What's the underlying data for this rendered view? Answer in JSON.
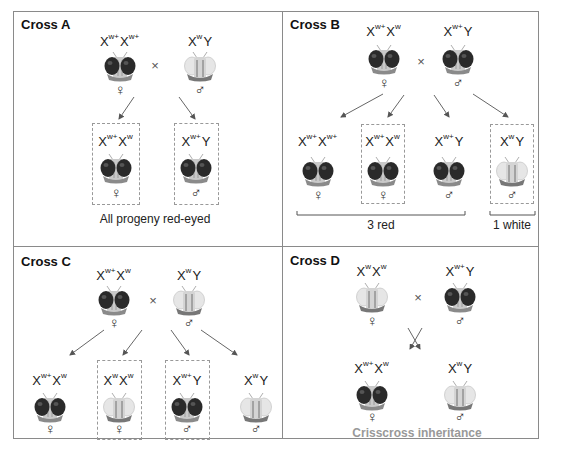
{
  "panels": {
    "A": {
      "title": "Cross A",
      "parents": [
        {
          "genotype_base": "X",
          "alleles": [
            "w+",
            "w+"
          ],
          "label": "Xw+Xw+",
          "sex": "♀",
          "eye": "red"
        },
        {
          "label": "XwY",
          "sex": "♂",
          "eye": "white"
        }
      ],
      "cross_symbol": "×",
      "progeny": [
        {
          "label": "Xw+Xw",
          "sex": "♀",
          "eye": "red",
          "boxed": true
        },
        {
          "label": "Xw+Y",
          "sex": "♂",
          "eye": "red",
          "boxed": true
        }
      ],
      "caption": "All progeny red-eyed"
    },
    "B": {
      "title": "Cross B",
      "parents": [
        {
          "label": "Xw+Xw",
          "sex": "♀",
          "eye": "red"
        },
        {
          "label": "Xw+Y",
          "sex": "♂",
          "eye": "red"
        }
      ],
      "cross_symbol": "×",
      "progeny": [
        {
          "label": "Xw+Xw+",
          "sex": "♀",
          "eye": "red",
          "boxed": false
        },
        {
          "label": "Xw+Xw",
          "sex": "♀",
          "eye": "red",
          "boxed": true
        },
        {
          "label": "Xw+Y",
          "sex": "♂",
          "eye": "red",
          "boxed": false
        },
        {
          "label": "XwY",
          "sex": "♂",
          "eye": "white",
          "boxed": true
        }
      ],
      "bracket_red": "3 red",
      "bracket_white": "1 white"
    },
    "C": {
      "title": "Cross C",
      "parents": [
        {
          "label": "Xw+Xw",
          "sex": "♀",
          "eye": "red"
        },
        {
          "label": "XwY",
          "sex": "♂",
          "eye": "white"
        }
      ],
      "cross_symbol": "×",
      "progeny": [
        {
          "label": "Xw+Xw",
          "sex": "♀",
          "eye": "red",
          "boxed": false
        },
        {
          "label": "XwXw",
          "sex": "♀",
          "eye": "white",
          "boxed": true
        },
        {
          "label": "Xw+Y",
          "sex": "♂",
          "eye": "red",
          "boxed": true
        },
        {
          "label": "XwY",
          "sex": "♂",
          "eye": "white",
          "boxed": false
        }
      ]
    },
    "D": {
      "title": "Cross D",
      "parents": [
        {
          "label": "XwXw",
          "sex": "♀",
          "eye": "white"
        },
        {
          "label": "Xw+Y",
          "sex": "♂",
          "eye": "red"
        }
      ],
      "cross_symbol": "×",
      "progeny": [
        {
          "label": "Xw+Xw",
          "sex": "♀",
          "eye": "red",
          "boxed": false
        },
        {
          "label": "XwY",
          "sex": "♂",
          "eye": "white",
          "boxed": false
        }
      ],
      "caption": "Crisscross inheritance"
    }
  },
  "symbols": {
    "x": "X",
    "y": "Y",
    "wplus": "w+",
    "w": "w",
    "female": "♀",
    "male": "♂",
    "times": "×"
  },
  "colors": {
    "border": "#8a8a8a",
    "dash": "#999999",
    "caption_gray": "#999999",
    "eye_red_dark": "#2a2a2a",
    "eye_white": "#e4e4e4"
  }
}
